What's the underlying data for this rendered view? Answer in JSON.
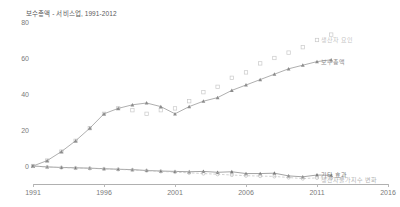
{
  "chart_data": {
    "type": "line",
    "title": "보수총액 - 서비스업, 1991-2012",
    "xlabel": "",
    "ylabel": "",
    "xlim": [
      1991,
      2016
    ],
    "ylim": [
      -10,
      80
    ],
    "grid": false,
    "legend_position": "inline-right",
    "x_ticks": [
      "1991",
      "1996",
      "2001",
      "2006",
      "2011",
      "2016"
    ],
    "x_tick_values": [
      1991,
      1996,
      2001,
      2006,
      2011,
      2016
    ],
    "y_ticks": [
      "0",
      "20",
      "40",
      "60",
      "80"
    ],
    "y_tick_values": [
      0,
      20,
      40,
      60,
      80
    ],
    "x": [
      1991,
      1992,
      1993,
      1994,
      1995,
      1996,
      1997,
      1998,
      1999,
      2000,
      2001,
      2002,
      2003,
      2004,
      2005,
      2006,
      2007,
      2008,
      2009,
      2010,
      2011,
      2012
    ],
    "series": [
      {
        "name": "생산자 요인",
        "color": "#c9c9c9",
        "marker": "square-open",
        "linestyle": "none",
        "values": [
          0,
          3,
          8,
          14,
          21,
          29,
          32,
          31,
          29,
          31,
          32,
          36,
          41,
          44,
          49,
          52,
          57,
          60,
          63,
          66,
          70,
          73
        ]
      },
      {
        "name": "보수총액",
        "color": "#8c8c8c",
        "marker": "triangle",
        "linestyle": "solid",
        "values": [
          0,
          3,
          8,
          14,
          21,
          29,
          32,
          34,
          35,
          33,
          29,
          33,
          36,
          38,
          42,
          45,
          48,
          51,
          54,
          56,
          58,
          59
        ]
      },
      {
        "name": "기타 효과",
        "color": "#7c7c7c",
        "marker": "triangle",
        "linestyle": "solid",
        "values": [
          0,
          -0.5,
          -0.8,
          -1.0,
          -1.2,
          -1.5,
          -1.8,
          -2.0,
          -2.5,
          -2.8,
          -3.0,
          -3.2,
          -3.0,
          -3.5,
          -3.2,
          -4.2,
          -4.2,
          -4.0,
          -5.5,
          -6.0,
          -5.0,
          -5.2
        ]
      },
      {
        "name": "생산자물가지수 변화",
        "color": "#bdbdbd",
        "marker": "circle-open",
        "linestyle": "dashed",
        "values": [
          0,
          -0.6,
          -0.9,
          -1.1,
          -1.3,
          -1.6,
          -1.9,
          -2.2,
          -2.6,
          -3.0,
          -3.4,
          -3.8,
          -4.2,
          -4.6,
          -5.0,
          -5.4,
          -5.6,
          -5.8,
          -6.4,
          -7.0,
          -6.6,
          -6.6
        ]
      }
    ],
    "legend_anchors": [
      {
        "name": "생산자 요인",
        "x": 2011.0,
        "y": 70.0
      },
      {
        "name": "보수총액",
        "x": 2011.0,
        "y": 58.0
      },
      {
        "name": "기타 효과",
        "x": 2011.0,
        "y": -5.0
      },
      {
        "name": "생산자물가지수 변화",
        "x": 2011.0,
        "y": -7.5
      }
    ]
  }
}
